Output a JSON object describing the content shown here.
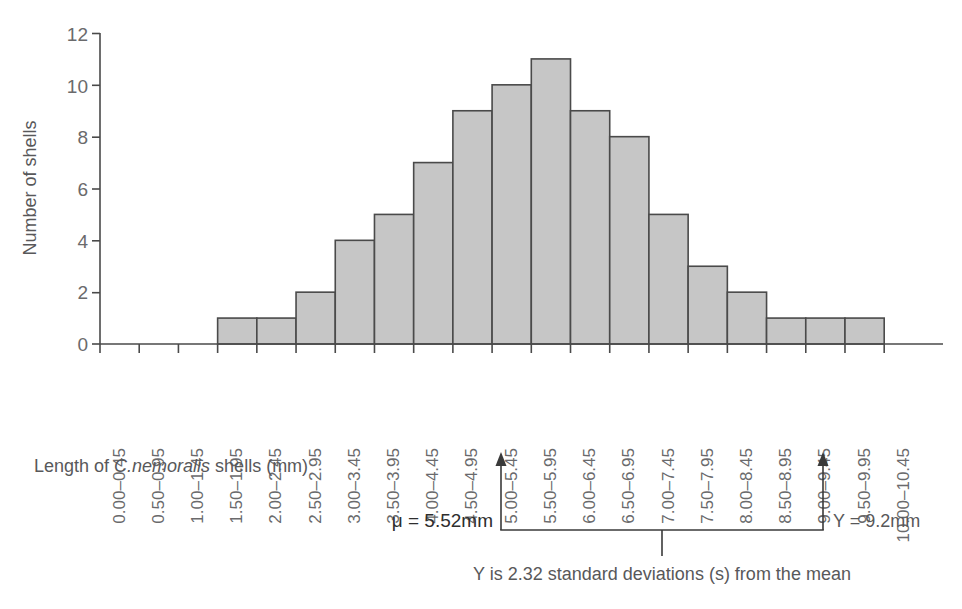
{
  "chart_data": {
    "type": "bar",
    "title": "",
    "xlabel": "Length of C.nemoralis shells (mm)",
    "xlabel_parts": {
      "before": "Length of ",
      "italic": "C.nemoralis",
      "after": " shells (mm)"
    },
    "ylabel": "Number of shells",
    "ylim": [
      0,
      12
    ],
    "ytick_values": [
      0,
      2,
      4,
      6,
      8,
      10,
      12
    ],
    "grid": false,
    "legend": "none",
    "categories": [
      "0.00–0.45",
      "0.50–0.95",
      "1.00–1.45",
      "1.50–1.95",
      "2.00–2.45",
      "2.50–2.95",
      "3.00–3.45",
      "3.50–3.95",
      "4.00–4.45",
      "4.50–4.95",
      "5.00–5.45",
      "5.50–5.95",
      "6.00–6.45",
      "6.50–6.95",
      "7.00–7.45",
      "7.50–7.95",
      "8.00–8.45",
      "8.50–8.95",
      "9.00–9.45",
      "9.50–9.95",
      "10.00–10.45"
    ],
    "values": [
      0,
      0,
      0,
      1,
      1,
      2,
      4,
      5,
      7,
      9,
      10,
      11,
      9,
      8,
      5,
      3,
      2,
      1,
      1,
      1,
      0
    ],
    "bar_fill_color": "#c6c6c6",
    "bar_stroke_color": "#4a4a4a"
  },
  "annotations": {
    "mean_label": "μ = 5.52mm",
    "value_label": "Y = 9.2mm",
    "caption": "Y is 2.32 standard deviations (s) from the mean",
    "mean_category_index": 11,
    "value_category_index": 19
  }
}
